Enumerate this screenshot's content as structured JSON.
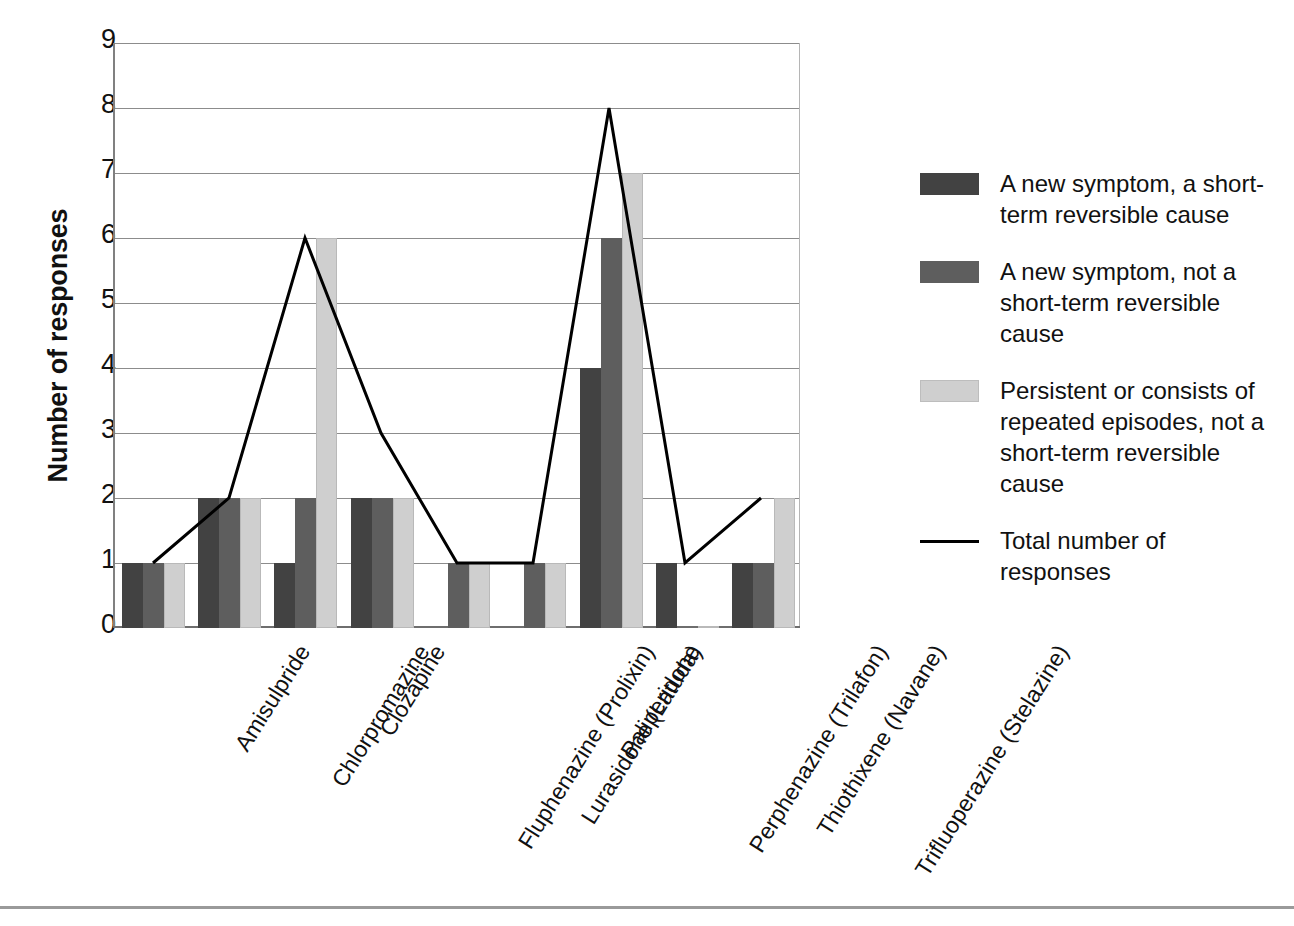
{
  "chart_data": {
    "type": "bar",
    "title": "",
    "xlabel": "",
    "ylabel": "Number of responses",
    "ylim": [
      0,
      9
    ],
    "yticks": [
      "0",
      "1",
      "2",
      "3",
      "4",
      "5",
      "6",
      "7",
      "8",
      "9"
    ],
    "grid": true,
    "legend_position": "right",
    "categories": [
      "Amisulpride",
      "Chlorpromazine",
      "Clozapine",
      "Fluphenazine (Prolixin)",
      "Lurasidone (Latuda)",
      "Paliperidone",
      "Perphenazine (Trilafon)",
      "Thiothixene (Navane)",
      "Trifluoperazine (Stelazine)"
    ],
    "series": [
      {
        "name": "A new symptom, a short-term reversible cause",
        "type": "bar",
        "color": "#424242",
        "values": [
          1,
          2,
          1,
          2,
          0,
          0,
          4,
          1,
          1
        ]
      },
      {
        "name": "A new symptom, not a short-term reversible cause",
        "type": "bar",
        "color": "#5e5e5e",
        "values": [
          1,
          2,
          2,
          2,
          1,
          1,
          6,
          0,
          1
        ]
      },
      {
        "name": "Persistent or consists of repeated episodes, not a short-term reversible cause",
        "type": "bar",
        "color": "#cfcfcf",
        "values": [
          1,
          2,
          6,
          2,
          1,
          1,
          7,
          0,
          2
        ]
      },
      {
        "name": "Total number of responses",
        "type": "line",
        "color": "#000000",
        "values": [
          1,
          2,
          6,
          3,
          1,
          1,
          8,
          1,
          2
        ]
      }
    ]
  },
  "legend": {
    "items": [
      {
        "swatch": "dark-gray-swatch",
        "label": "A new symptom, a short-term reversible cause"
      },
      {
        "swatch": "medium-gray-swatch",
        "label": "A new symptom, not a short-term reversible cause"
      },
      {
        "swatch": "light-gray-swatch",
        "label": "Persistent or consists of repeated episodes, not a short-term reversible cause"
      },
      {
        "swatch": "black-line-swatch",
        "label": "Total number of responses"
      }
    ]
  },
  "axes": {
    "y_title": "Number of responses"
  }
}
